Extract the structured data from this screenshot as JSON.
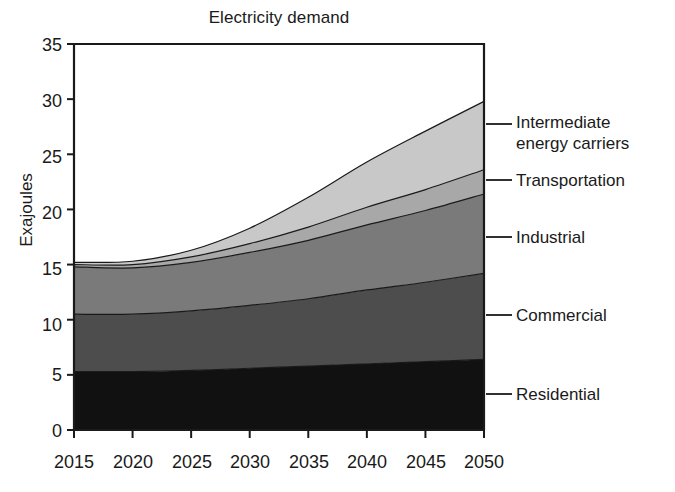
{
  "chart_data": {
    "type": "area",
    "title": "Electricity demand",
    "xlabel": "",
    "ylabel": "Exajoules",
    "stacked": true,
    "legend_position": "right-leader-lines",
    "grid": false,
    "xlim": [
      2015,
      2050
    ],
    "ylim": [
      0,
      35
    ],
    "yticks": [
      0,
      5,
      10,
      15,
      20,
      25,
      30,
      35
    ],
    "xticks": [
      2015,
      2020,
      2025,
      2030,
      2035,
      2040,
      2045,
      2050
    ],
    "x": [
      2015,
      2020,
      2025,
      2030,
      2035,
      2040,
      2045,
      2050
    ],
    "series": [
      {
        "name": "Residential",
        "color": "#111111",
        "values": [
          5.3,
          5.3,
          5.4,
          5.6,
          5.8,
          6.0,
          6.2,
          6.4
        ]
      },
      {
        "name": "Commercial",
        "color": "#4d4d4d",
        "values": [
          5.2,
          5.2,
          5.4,
          5.7,
          6.1,
          6.7,
          7.2,
          7.8
        ]
      },
      {
        "name": "Industrial",
        "color": "#7a7a7a",
        "values": [
          4.3,
          4.2,
          4.4,
          4.8,
          5.3,
          5.9,
          6.5,
          7.2
        ]
      },
      {
        "name": "Transportation",
        "color": "#a8a8a8",
        "values": [
          0.2,
          0.3,
          0.5,
          0.8,
          1.2,
          1.6,
          1.9,
          2.2
        ]
      },
      {
        "name": "Intermediate energy carriers",
        "color": "#c8c8c8",
        "values": [
          0.2,
          0.3,
          0.6,
          1.4,
          2.7,
          4.1,
          5.3,
          6.2
        ]
      }
    ],
    "totals": [
      15.2,
      15.3,
      16.3,
      18.3,
      21.1,
      24.3,
      27.1,
      29.8
    ]
  },
  "legend": {
    "items": [
      {
        "label": "Intermediate\nenergy carriers"
      },
      {
        "label": "Transportation"
      },
      {
        "label": "Industrial"
      },
      {
        "label": "Commercial"
      },
      {
        "label": "Residential"
      }
    ]
  },
  "axis": {
    "ytick_labels": [
      "35",
      "30",
      "25",
      "20",
      "15",
      "10",
      "5",
      "0"
    ],
    "xtick_labels": [
      "2015",
      "2020",
      "2025",
      "2030",
      "2035",
      "2040",
      "2045",
      "2050"
    ]
  }
}
